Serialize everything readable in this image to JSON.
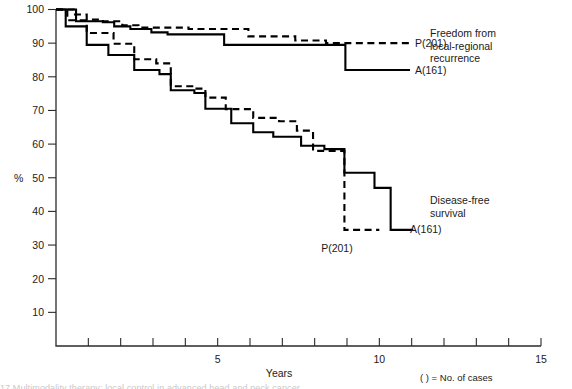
{
  "chart_data": {
    "type": "line",
    "title": "",
    "xlabel": "Years",
    "ylabel": "%",
    "xlim": [
      0,
      15
    ],
    "ylim": [
      0,
      100
    ],
    "grid": false,
    "legend_position": "right-of-plot",
    "x_ticks": [
      0,
      1,
      2,
      3,
      4,
      5,
      6,
      7,
      8,
      9,
      10,
      11,
      12,
      13,
      14,
      15
    ],
    "x_tick_labels": {
      "5": "5",
      "10": "10",
      "15": "15"
    },
    "y_ticks": [
      10,
      20,
      30,
      40,
      50,
      60,
      70,
      80,
      90,
      100
    ],
    "y_tick_labels": [
      "10",
      "20",
      "30",
      "40",
      "50",
      "60",
      "70",
      "80",
      "90",
      "100"
    ],
    "step_style": "post",
    "groups": [
      {
        "name": "Freedom from local-regional recurrence",
        "annotation": "Freedom from\nlocal-regional\nrecurrence",
        "series": [
          {
            "name": "P(201)",
            "label": "P(201)",
            "style": "dashed",
            "label_x": 11.1,
            "label_y": 90.0,
            "points": [
              [
                0.0,
                100
              ],
              [
                0.55,
                100
              ],
              [
                0.55,
                98.5
              ],
              [
                0.95,
                98.5
              ],
              [
                0.95,
                97.0
              ],
              [
                1.45,
                97.0
              ],
              [
                1.45,
                96.5
              ],
              [
                2.05,
                96.5
              ],
              [
                2.05,
                95.3
              ],
              [
                2.55,
                95.3
              ],
              [
                2.55,
                94.6
              ],
              [
                4.1,
                94.6
              ],
              [
                4.1,
                94.2
              ],
              [
                5.95,
                94.2
              ],
              [
                5.95,
                92.0
              ],
              [
                7.4,
                92.0
              ],
              [
                7.4,
                90.8
              ],
              [
                8.35,
                90.8
              ],
              [
                8.35,
                90.0
              ],
              [
                10.95,
                90.0
              ]
            ]
          },
          {
            "name": "A(161)",
            "label": "A(161)",
            "style": "solid",
            "label_x": 11.1,
            "label_y": 82.0,
            "points": [
              [
                0.0,
                100
              ],
              [
                0.62,
                100
              ],
              [
                0.62,
                96.5
              ],
              [
                1.45,
                96.5
              ],
              [
                1.45,
                96.2
              ],
              [
                1.8,
                96.2
              ],
              [
                1.8,
                95.0
              ],
              [
                2.3,
                95.0
              ],
              [
                2.3,
                94.2
              ],
              [
                2.95,
                94.2
              ],
              [
                2.95,
                93.2
              ],
              [
                3.45,
                93.2
              ],
              [
                3.45,
                92.6
              ],
              [
                5.2,
                92.6
              ],
              [
                5.2,
                89.5
              ],
              [
                8.95,
                89.5
              ],
              [
                8.95,
                82.0
              ],
              [
                10.95,
                82.0
              ]
            ]
          }
        ]
      },
      {
        "name": "Disease-free survival",
        "annotation": "Disease-free\nsurvival",
        "series": [
          {
            "name": "P(201)",
            "label": "P(201)",
            "style": "dashed",
            "label_x": 8.2,
            "label_y": 29.0,
            "points": [
              [
                0.0,
                100
              ],
              [
                0.35,
                100
              ],
              [
                0.35,
                96.8
              ],
              [
                0.95,
                96.8
              ],
              [
                0.95,
                93.0
              ],
              [
                1.78,
                93.0
              ],
              [
                1.78,
                89.8
              ],
              [
                2.42,
                89.8
              ],
              [
                2.42,
                85.2
              ],
              [
                3.1,
                85.2
              ],
              [
                3.1,
                84.0
              ],
              [
                3.55,
                84.0
              ],
              [
                3.55,
                77.2
              ],
              [
                4.25,
                77.2
              ],
              [
                4.25,
                76.5
              ],
              [
                4.62,
                76.5
              ],
              [
                4.62,
                73.8
              ],
              [
                5.25,
                73.8
              ],
              [
                5.25,
                70.4
              ],
              [
                6.1,
                70.4
              ],
              [
                6.1,
                67.8
              ],
              [
                6.9,
                67.8
              ],
              [
                6.9,
                66.8
              ],
              [
                7.45,
                66.8
              ],
              [
                7.45,
                64.0
              ],
              [
                7.95,
                64.0
              ],
              [
                7.95,
                58.0
              ],
              [
                8.92,
                58.0
              ],
              [
                8.92,
                34.5
              ],
              [
                10.0,
                34.5
              ]
            ]
          },
          {
            "name": "A(161)",
            "label": "A(161)",
            "style": "solid",
            "label_x": 10.95,
            "label_y": 34.5,
            "points": [
              [
                0.0,
                100
              ],
              [
                0.3,
                100
              ],
              [
                0.3,
                95.0
              ],
              [
                0.95,
                95.0
              ],
              [
                0.95,
                89.5
              ],
              [
                1.62,
                89.5
              ],
              [
                1.62,
                86.5
              ],
              [
                2.42,
                86.5
              ],
              [
                2.42,
                82.0
              ],
              [
                3.2,
                82.0
              ],
              [
                3.2,
                80.8
              ],
              [
                3.55,
                80.8
              ],
              [
                3.55,
                76.0
              ],
              [
                4.28,
                76.0
              ],
              [
                4.28,
                75.2
              ],
              [
                4.62,
                75.2
              ],
              [
                4.62,
                70.5
              ],
              [
                5.42,
                70.5
              ],
              [
                5.42,
                66.2
              ],
              [
                6.1,
                66.2
              ],
              [
                6.1,
                63.5
              ],
              [
                6.72,
                63.5
              ],
              [
                6.72,
                62.2
              ],
              [
                7.58,
                62.2
              ],
              [
                7.58,
                59.5
              ],
              [
                8.3,
                59.5
              ],
              [
                8.3,
                58.5
              ],
              [
                8.92,
                58.5
              ],
              [
                8.92,
                51.5
              ],
              [
                9.85,
                51.5
              ],
              [
                9.85,
                47.0
              ],
              [
                10.35,
                47.0
              ],
              [
                10.35,
                34.5
              ],
              [
                11.05,
                34.5
              ]
            ]
          }
        ]
      }
    ],
    "footnote": "(   ) = No. of cases"
  },
  "annotations": {
    "freedom_label_line1": "Freedom from",
    "freedom_label_line2": "local-regional",
    "freedom_label_line3": "recurrence",
    "dfs_label_line1": "Disease-free",
    "dfs_label_line2": "survival"
  },
  "footer": {
    "cases_note": "(   ) = No. of cases",
    "clipped_caption": "17  Multimodality therapy: local control in advanced head and neck cancer"
  }
}
